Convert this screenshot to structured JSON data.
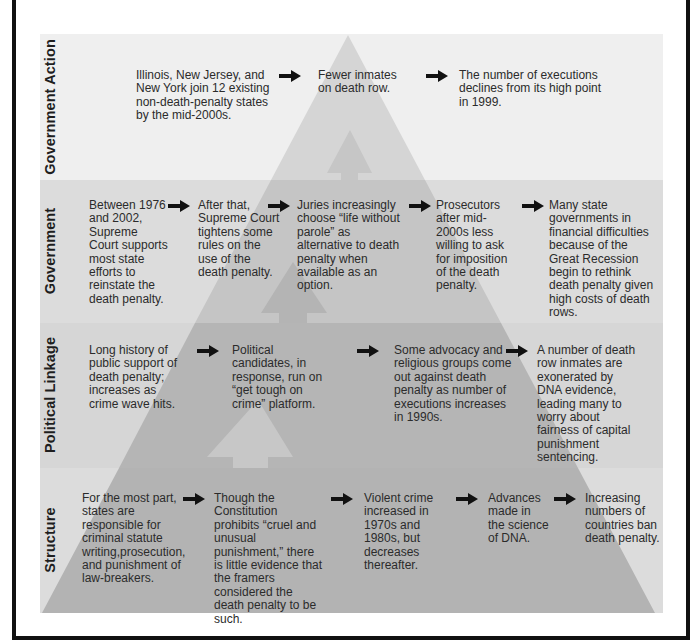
{
  "diagram": {
    "type": "layered-pyramid-flow",
    "colors": {
      "band_government_action": "#efefef",
      "band_government": "#dcdcdc",
      "band_political_linkage": "#d6d6d6",
      "band_structure": "#dcdcdc",
      "pyramid_government_action": "#d4d4d4",
      "pyramid_government": "#c4c4c4",
      "pyramid_political_linkage": "#b4b4b4",
      "pyramid_structure": "#b3b3b3",
      "arrow": "#111111",
      "frame": "#111111"
    },
    "bands": [
      {
        "label": "Government Action",
        "nodes": [
          "Illinois, New Jersey, and New York join 12 existing non-death-penalty states by the mid-2000s.",
          "Fewer inmates on death row.",
          "The number of executions declines from its high point in 1999."
        ]
      },
      {
        "label": "Government",
        "nodes": [
          "Between 1976 and 2002, Supreme Court supports most state efforts to reinstate the death penalty.",
          "After that, Supreme Court tightens some rules on the use of the death penalty.",
          "Juries increasingly choose “life without parole” as alternative to death penalty when available as an option.",
          "Prosecutors after mid-2000s less willing to ask for imposition of the death penalty.",
          "Many state governments in financial difficulties because of the Great Recession begin to rethink death penalty given high costs of death rows."
        ]
      },
      {
        "label": "Political Linkage",
        "nodes": [
          "Long history of public support of death penalty; increases as crime wave hits.",
          "Political candidates, in response, run on “get tough on crime” platform.",
          "Some advocacy and religious groups come out against death penalty as number of executions increases in 1990s.",
          "A number of death row inmates are exonerated by DNA evidence, leading many to worry about fairness of capital punishment sentencing."
        ]
      },
      {
        "label": "Structure",
        "nodes": [
          "For the most part, states are responsible for criminal statute writing,prosecution, and punishment of law-breakers.",
          "Though the Constitution prohibits “cruel and unusual punishment,” there is little evidence that the framers considered the death penalty to be such.",
          "Violent crime increased in 1970s and 1980s, but decreases thereafter.",
          "Advances made in the science of DNA.",
          "Increasing numbers of countries ban death penalty."
        ]
      }
    ]
  }
}
